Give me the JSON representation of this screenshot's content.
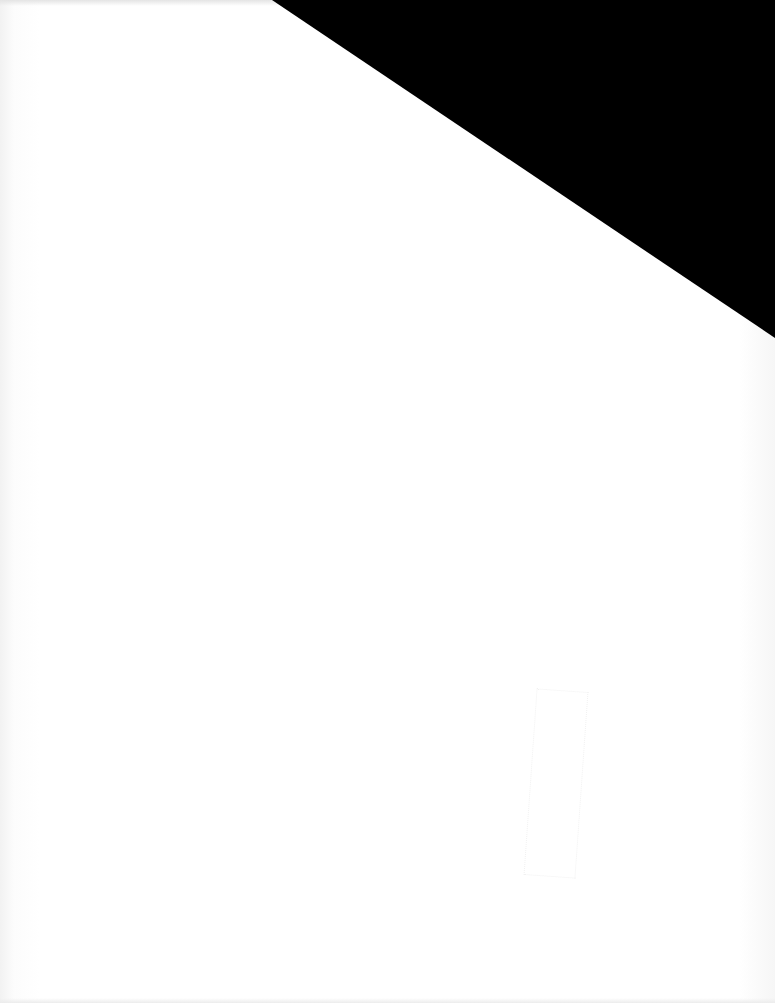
{
  "document": {
    "type": "scanned-page",
    "text": "",
    "colors": {
      "paper": "#ffffff",
      "occlusion": "#000000"
    },
    "occlusion_region": {
      "shape": "triangle",
      "points": [
        [
          272,
          0
        ],
        [
          775,
          0
        ],
        [
          775,
          338
        ]
      ]
    }
  }
}
